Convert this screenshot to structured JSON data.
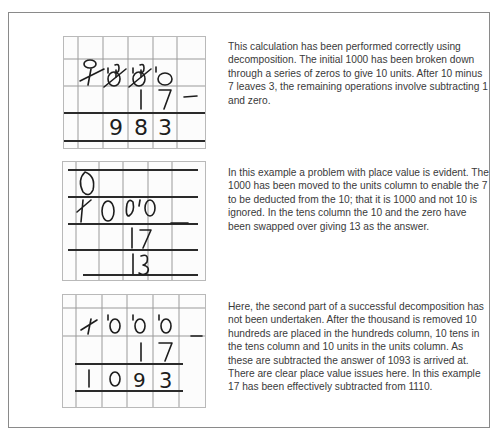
{
  "examples": [
    {
      "worked": {
        "top_row_marks": [
          "0",
          "1 9",
          "1 9",
          "1"
        ],
        "minuend": [
          "1",
          "0",
          "0",
          "0"
        ],
        "subtrahend": [
          "",
          "",
          "1",
          "7"
        ],
        "operator": "−",
        "answer": [
          "",
          "9",
          "8",
          "3"
        ]
      },
      "description": "This calculation has been performed correctly using decomposition. The initial 1000 has been broken down through a series of zeros to give 10 units. After 10 minus 7 leaves 3, the remaining operations involve subtracting 1 and zero."
    },
    {
      "worked": {
        "top_row_marks": [
          "0",
          "",
          "",
          "1"
        ],
        "minuend": [
          "1",
          "0",
          "0",
          "0"
        ],
        "subtrahend": [
          "",
          "",
          "1",
          "7"
        ],
        "operator": "−",
        "answer": [
          "",
          "",
          "1",
          "3"
        ]
      },
      "description": "In this example a problem with place value is evident. The 1000 has been moved to the units column to enable the 7 to be deducted from the 10; that it is 1000 and not 10 is ignored. In the tens column the 10 and the zero have been swapped over giving 13 as the answer."
    },
    {
      "worked": {
        "top_row_marks": [
          "",
          "1",
          "1",
          "1"
        ],
        "minuend": [
          "1",
          "0",
          "0",
          "0"
        ],
        "subtrahend": [
          "",
          "",
          "1",
          "7"
        ],
        "operator": "−",
        "answer": [
          "1",
          "0",
          "9",
          "3"
        ]
      },
      "description": "Here, the second part of a successful decomposition has not been undertaken. After the thousand is removed 10 hundreds are placed in the hundreds column, 10 tens in the tens column and 10 units in the units column. As these are subtracted the answer of 1093 is arrived at. There are clear place value issues here. In this example 17 has been effectively subtracted from 1110."
    }
  ]
}
